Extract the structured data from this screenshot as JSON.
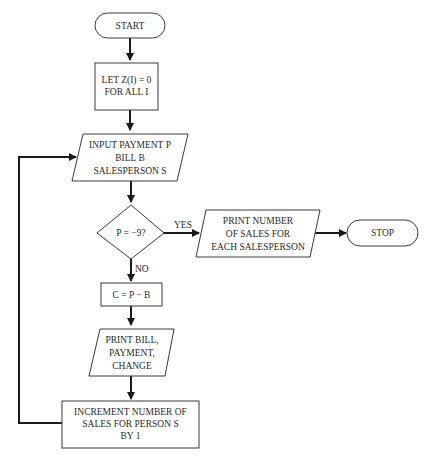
{
  "flowchart": {
    "nodes": {
      "start": {
        "type": "terminator",
        "text": "START"
      },
      "init": {
        "type": "process",
        "lines": [
          "LET Z(I) = 0",
          "FOR ALL I"
        ]
      },
      "input": {
        "type": "io",
        "lines": [
          "INPUT PAYMENT P",
          "BILL B",
          "SALESPERSON S"
        ]
      },
      "decision": {
        "type": "decision",
        "text": "P = −9?"
      },
      "print_sales": {
        "type": "io",
        "lines": [
          "PRINT NUMBER",
          "OF SALES FOR",
          "EACH SALESPERSON"
        ]
      },
      "stop": {
        "type": "terminator",
        "text": "STOP"
      },
      "change": {
        "type": "process",
        "text": "C = P − B"
      },
      "print_bill": {
        "type": "io",
        "lines": [
          "PRINT BILL,",
          "PAYMENT,",
          "CHANGE"
        ]
      },
      "increment": {
        "type": "process",
        "lines": [
          "INCREMENT NUMBER OF",
          "SALES FOR PERSON S",
          "BY 1"
        ]
      }
    },
    "edge_labels": {
      "yes": "YES",
      "no": "NO"
    },
    "edges": [
      [
        "start",
        "init"
      ],
      [
        "init",
        "input"
      ],
      [
        "input",
        "decision"
      ],
      [
        "decision",
        "print_sales",
        "YES"
      ],
      [
        "print_sales",
        "stop"
      ],
      [
        "decision",
        "change",
        "NO"
      ],
      [
        "change",
        "print_bill"
      ],
      [
        "print_bill",
        "increment"
      ],
      [
        "increment",
        "input"
      ]
    ]
  }
}
